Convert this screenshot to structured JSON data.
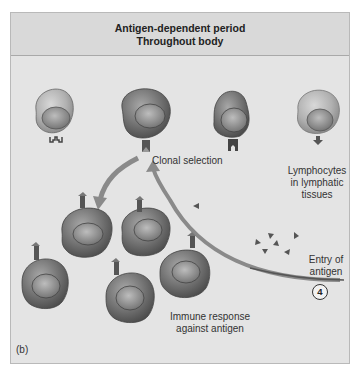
{
  "header": {
    "title_line1": "Antigen-dependent period",
    "title_line2": "Throughout body"
  },
  "labels": {
    "clonal_selection": "Clonal selection",
    "lymphocytes": [
      "Lymphocytes",
      "in lymphatic",
      "tissues"
    ],
    "entry_of_antigen": [
      "Entry of",
      "antigen"
    ],
    "immune_response": [
      "Immune response",
      "against antigen"
    ],
    "panel_label": "(b)",
    "step_number": "4"
  },
  "colors": {
    "background": "#e4e4e4",
    "header_band": "#d9d9d9",
    "cell_dark": "#6e6e6e",
    "cell_light": "#a9a9a9",
    "arrow": "#8a8a8a",
    "text": "#333333"
  },
  "shapes": {
    "top_row_cells": [
      {
        "cx": 54,
        "cy": 118,
        "shade": "light",
        "receptor": "forked"
      },
      {
        "cx": 147,
        "cy": 118,
        "shade": "dark",
        "receptor": "selected"
      },
      {
        "cx": 232,
        "cy": 118,
        "shade": "dark",
        "receptor": "notch"
      },
      {
        "cx": 318,
        "cy": 118,
        "shade": "light",
        "receptor": "arrow-down"
      }
    ],
    "clone_cells": [
      {
        "cx": 86,
        "cy": 240
      },
      {
        "cx": 146,
        "cy": 234
      },
      {
        "cx": 44,
        "cy": 290
      },
      {
        "cx": 130,
        "cy": 302
      },
      {
        "cx": 188,
        "cy": 280
      }
    ],
    "antigen_triangles": 8
  }
}
